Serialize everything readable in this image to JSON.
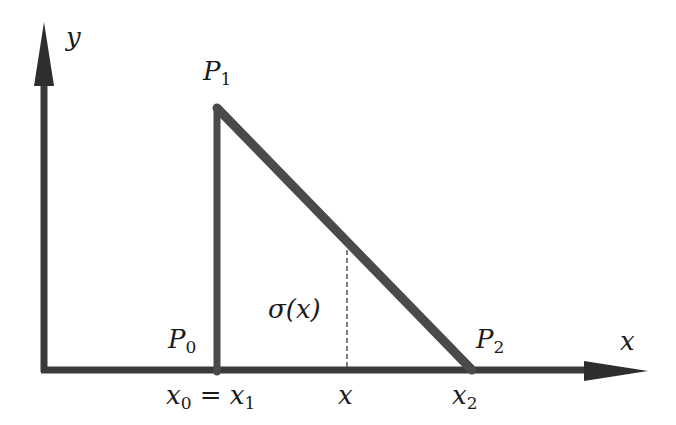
{
  "diagram": {
    "type": "triangular-distribution-sketch",
    "colors": {
      "line": "#4a4a4a",
      "axis": "#3a3a3a",
      "text": "#1a1a1a",
      "background": "#ffffff"
    },
    "axes": {
      "x_label": "x",
      "y_label": "y"
    },
    "points": {
      "P0": {
        "name": "P",
        "sub": "0",
        "x": 217,
        "y": 370
      },
      "P1": {
        "name": "P",
        "sub": "1",
        "x": 217,
        "y": 108
      },
      "P2": {
        "name": "P",
        "sub": "2",
        "x": 472,
        "y": 370
      }
    },
    "ticks": {
      "x0_eq_x1": {
        "a": "x",
        "a_sub": "0",
        "eq": "=",
        "b": "x",
        "b_sub": "1"
      },
      "x": {
        "text": "x"
      },
      "x2": {
        "text": "x",
        "sub": "2"
      }
    },
    "sigma_label": {
      "text": "σ(x)"
    },
    "dashed_x": 347
  }
}
